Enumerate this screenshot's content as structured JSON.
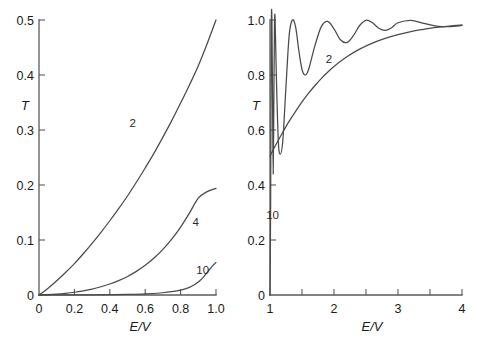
{
  "figure": {
    "background_color": "#ffffff",
    "curve_color": "#4a4a4a",
    "axis_color": "#5a5a5a"
  },
  "chart_data": [
    {
      "type": "line",
      "panel": "left",
      "title": "",
      "xlabel": "E/V",
      "ylabel": "T",
      "xlim": [
        0,
        1
      ],
      "ylim": [
        0,
        0.5
      ],
      "grid": false,
      "legend_position": "inline-curve-labels",
      "xticks": [
        "0",
        "0.2",
        "0.4",
        "0.6",
        "0.8",
        "1.0"
      ],
      "xtick_values": [
        0,
        0.2,
        0.4,
        0.6,
        0.8,
        1.0
      ],
      "yticks": [
        "0",
        "0.1",
        "0.2",
        "0.3",
        "0.4",
        "0.5"
      ],
      "ytick_values": [
        0,
        0.1,
        0.2,
        0.3,
        0.4,
        0.5
      ],
      "series": [
        {
          "name": "2",
          "label": "2",
          "label_x": 0.53,
          "label_y": 0.305,
          "x": [
            0.0,
            0.05,
            0.1,
            0.15,
            0.2,
            0.25,
            0.3,
            0.35,
            0.4,
            0.45,
            0.5,
            0.55,
            0.6,
            0.65,
            0.7,
            0.75,
            0.8,
            0.85,
            0.9,
            0.95,
            1.0
          ],
          "y": [
            0.0,
            0.012,
            0.026,
            0.041,
            0.057,
            0.075,
            0.094,
            0.114,
            0.135,
            0.157,
            0.18,
            0.205,
            0.231,
            0.258,
            0.287,
            0.317,
            0.349,
            0.382,
            0.417,
            0.457,
            0.5
          ]
        },
        {
          "name": "4",
          "label": "4",
          "label_x": 0.885,
          "label_y": 0.125,
          "x": [
            0.0,
            0.05,
            0.1,
            0.15,
            0.2,
            0.25,
            0.3,
            0.35,
            0.4,
            0.45,
            0.5,
            0.55,
            0.6,
            0.65,
            0.7,
            0.75,
            0.8,
            0.85,
            0.9,
            0.95,
            1.0
          ],
          "y": [
            0.0,
            0.0006,
            0.0016,
            0.003,
            0.005,
            0.0076,
            0.0108,
            0.015,
            0.02,
            0.0262,
            0.0337,
            0.043,
            0.054,
            0.0672,
            0.083,
            0.1015,
            0.1235,
            0.149,
            0.176,
            0.188,
            0.194
          ]
        },
        {
          "name": "10",
          "label": "10",
          "label_x": 0.925,
          "label_y": 0.038,
          "x": [
            0.0,
            0.1,
            0.2,
            0.3,
            0.4,
            0.5,
            0.6,
            0.7,
            0.75,
            0.8,
            0.85,
            0.88,
            0.91,
            0.93,
            0.95,
            0.97,
            0.98,
            0.99,
            1.0
          ],
          "y": [
            0.0,
            2e-05,
            8e-05,
            0.0002,
            0.0005,
            0.001,
            0.002,
            0.0041,
            0.006,
            0.009,
            0.014,
            0.019,
            0.0265,
            0.033,
            0.041,
            0.049,
            0.053,
            0.056,
            0.059
          ]
        }
      ]
    },
    {
      "type": "line",
      "panel": "right",
      "title": "",
      "xlabel": "E/V",
      "ylabel": "T",
      "xlim": [
        1,
        4
      ],
      "ylim": [
        0,
        1.0
      ],
      "grid": false,
      "legend_position": "inline-curve-labels",
      "xticks": [
        "1",
        "2",
        "3",
        "4"
      ],
      "xtick_values": [
        1,
        2,
        3,
        4
      ],
      "xminor_ticks": [
        1.5,
        2.5,
        3.5
      ],
      "yticks": [
        "0",
        "0.2",
        "0.4",
        "0.6",
        "0.8",
        "1.0"
      ],
      "ytick_values": [
        0,
        0.2,
        0.4,
        0.6,
        0.8,
        1.0
      ],
      "series": [
        {
          "name": "2",
          "label": "2",
          "label_x": 1.92,
          "label_y": 0.845,
          "x": [
            1.0,
            1.05,
            1.1,
            1.2,
            1.3,
            1.4,
            1.5,
            1.6,
            1.7,
            1.8,
            1.9,
            2.0,
            2.2,
            2.4,
            2.6,
            2.8,
            3.0,
            3.2,
            3.4,
            3.6,
            3.8,
            4.0
          ],
          "y": [
            0.505,
            0.528,
            0.55,
            0.592,
            0.632,
            0.668,
            0.702,
            0.733,
            0.761,
            0.787,
            0.81,
            0.831,
            0.866,
            0.894,
            0.916,
            0.933,
            0.947,
            0.958,
            0.966,
            0.973,
            0.978,
            0.982
          ]
        },
        {
          "name": "10",
          "label": "10",
          "label_x": 1.04,
          "label_y": 0.275,
          "x": [
            1.0,
            1.01,
            1.02,
            1.03,
            1.04,
            1.05,
            1.06,
            1.07,
            1.08,
            1.1,
            1.13,
            1.16,
            1.2,
            1.25,
            1.3,
            1.35,
            1.4,
            1.45,
            1.5,
            1.55,
            1.6,
            1.7,
            1.8,
            1.9,
            2.0,
            2.1,
            2.2,
            2.3,
            2.4,
            2.5,
            2.6,
            2.7,
            2.8,
            2.9,
            3.0,
            3.2,
            3.4,
            3.6,
            3.8,
            4.0
          ],
          "y": [
            0.0,
            0.33,
            0.96,
            1.0,
            0.7,
            0.44,
            0.7,
            0.98,
            1.0,
            0.79,
            0.56,
            0.512,
            0.56,
            0.76,
            0.945,
            1.0,
            0.975,
            0.89,
            0.82,
            0.8,
            0.818,
            0.905,
            0.975,
            0.995,
            0.968,
            0.928,
            0.918,
            0.942,
            0.98,
            0.999,
            0.99,
            0.97,
            0.962,
            0.972,
            0.99,
            0.999,
            0.988,
            0.978,
            0.976,
            0.98
          ]
        }
      ]
    }
  ]
}
